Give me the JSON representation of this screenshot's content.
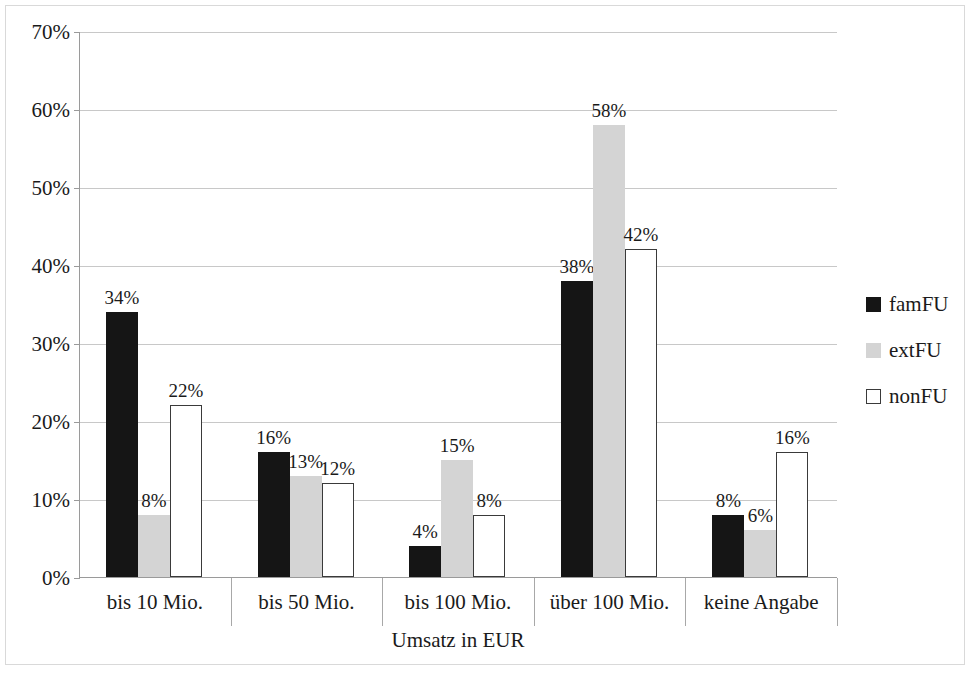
{
  "chart_data": {
    "type": "bar",
    "title": "",
    "xlabel": "Umsatz in EUR",
    "ylabel": "",
    "categories": [
      "bis 10 Mio.",
      "bis 50 Mio.",
      "bis 100 Mio.",
      "über 100 Mio.",
      "keine Angabe"
    ],
    "series": [
      {
        "name": "famFU",
        "color": "#151515",
        "values": [
          34,
          16,
          4,
          38,
          8
        ],
        "labels": [
          "34%",
          "16%",
          "4%",
          "38%",
          "8%"
        ]
      },
      {
        "name": "extFU",
        "color": "#d4d4d4",
        "values": [
          8,
          13,
          15,
          58,
          6
        ],
        "labels": [
          "8%",
          "13%",
          "15%",
          "58%",
          "6%"
        ]
      },
      {
        "name": "nonFU",
        "color": "#ffffff",
        "values": [
          22,
          12,
          8,
          42,
          16
        ],
        "labels": [
          "22%",
          "12%",
          "8%",
          "42%",
          "16%"
        ]
      }
    ],
    "ylim": [
      0,
      70
    ],
    "ytick_step": 10,
    "yticks": [
      0,
      10,
      20,
      30,
      40,
      50,
      60,
      70
    ],
    "ytick_labels": [
      "0%",
      "10%",
      "20%",
      "30%",
      "40%",
      "50%",
      "60%",
      "70%"
    ],
    "grid": true,
    "legend_position": "right",
    "value_suffix": "%"
  },
  "legend": {
    "entries": [
      {
        "label": "famFU",
        "swatch": "famFU"
      },
      {
        "label": "extFU",
        "swatch": "extFU"
      },
      {
        "label": "nonFU",
        "swatch": "nonFU"
      }
    ]
  }
}
